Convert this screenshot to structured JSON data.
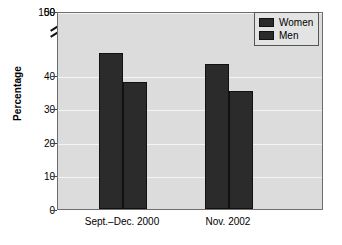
{
  "chart_data": {
    "type": "bar",
    "title": "",
    "subtitle": "",
    "xlabel": "",
    "ylabel": "Percentage",
    "categories": [
      "Sept.–Dec. 2000",
      "Nov. 2002"
    ],
    "series": [
      {
        "name": "Women",
        "values": [
          46.5,
          43.3
        ]
      },
      {
        "name": "Men",
        "values": [
          37.8,
          35.2
        ]
      }
    ],
    "ylim": [
      0,
      100
    ],
    "yticks": [
      0,
      10,
      20,
      30,
      40,
      50,
      100
    ],
    "ytick_labels": [
      "0",
      "10",
      "20",
      "30",
      "40",
      "50",
      "100"
    ],
    "axis_break": {
      "present": true,
      "between": [
        50,
        100
      ],
      "style": "double-slash"
    },
    "grid": true,
    "grid_axis": "y",
    "legend_position": "top-right",
    "legend_entries": [
      "Women",
      "Men"
    ],
    "colors": {
      "bar": "#2b2b2b",
      "bar_edge": "#111111",
      "plot_background": "#dcdcdc",
      "gridline": "#f4f4f4",
      "axis": "#6e6e6e",
      "text": "#000000",
      "legend_background": "#e3e3e3",
      "page_background": "#ffffff"
    }
  },
  "yaxis": {
    "title": "Percentage",
    "ticks": [
      {
        "label": "100",
        "value": 100
      },
      {
        "label": "50",
        "value": 50
      },
      {
        "label": "40",
        "value": 40
      },
      {
        "label": "30",
        "value": 30
      },
      {
        "label": "20",
        "value": 20
      },
      {
        "label": "10",
        "value": 10
      },
      {
        "label": "0",
        "value": 0
      }
    ]
  },
  "xaxis": {
    "ticks": [
      {
        "label": "Sept.–Dec. 2000"
      },
      {
        "label": "Nov. 2002"
      }
    ]
  },
  "legend": {
    "items": [
      {
        "label": "Women"
      },
      {
        "label": "Men"
      }
    ]
  },
  "bars": [
    {
      "group": "Sept.–Dec. 2000",
      "series": "Women",
      "value": 46.5
    },
    {
      "group": "Sept.–Dec. 2000",
      "series": "Men",
      "value": 37.8
    },
    {
      "group": "Nov. 2002",
      "series": "Women",
      "value": 43.3
    },
    {
      "group": "Nov. 2002",
      "series": "Men",
      "value": 35.2
    }
  ]
}
